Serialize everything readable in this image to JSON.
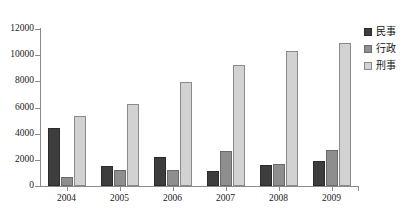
{
  "chart_data": {
    "type": "bar",
    "title": "",
    "subtitle": "",
    "xlabel": "",
    "ylabel": "",
    "categories": [
      "2004",
      "2005",
      "2006",
      "2007",
      "2008",
      "2009"
    ],
    "series": [
      {
        "name": "民事",
        "color": "#3d3d3d",
        "values": [
          4450,
          1530,
          2220,
          1180,
          1600,
          1920
        ]
      },
      {
        "name": "行政",
        "color": "#8e8e8e",
        "values": [
          680,
          1230,
          1220,
          2650,
          1680,
          2760
        ]
      },
      {
        "name": "刑事",
        "color": "#d2d2d2",
        "values": [
          5380,
          6250,
          7950,
          9280,
          10300,
          10900
        ]
      }
    ],
    "ylim": [
      0,
      12000
    ],
    "yticks": [
      0,
      2000,
      4000,
      6000,
      8000,
      10000,
      12000
    ],
    "ytick_labels": [
      "0",
      "2000",
      "4000",
      "6000",
      "8000",
      "10000",
      "12000"
    ],
    "grid": false,
    "legend_position": "right",
    "axis_color": "#8a8a8a"
  }
}
